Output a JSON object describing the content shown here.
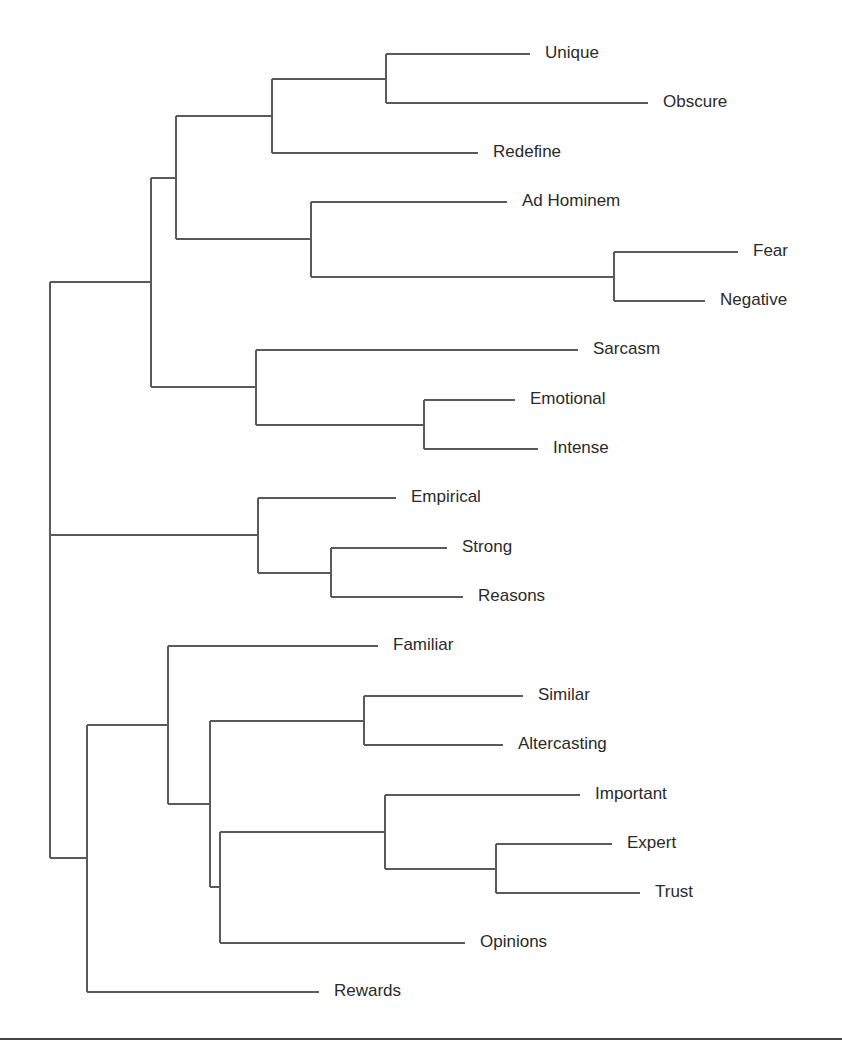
{
  "chart_data": {
    "type": "dendrogram",
    "title": "",
    "orientation": "horizontal",
    "leaves": [
      {
        "id": "unique",
        "label": "Unique",
        "y": 54,
        "x_end": 530
      },
      {
        "id": "obscure",
        "label": "Obscure",
        "y": 103,
        "x_end": 648
      },
      {
        "id": "redefine",
        "label": "Redefine",
        "y": 153,
        "x_end": 478
      },
      {
        "id": "ad-hominem",
        "label": "Ad Hominem",
        "y": 202,
        "x_end": 507
      },
      {
        "id": "fear",
        "label": "Fear",
        "y": 252,
        "x_end": 738
      },
      {
        "id": "negative",
        "label": "Negative",
        "y": 301,
        "x_end": 705
      },
      {
        "id": "sarcasm",
        "label": "Sarcasm",
        "y": 350,
        "x_end": 578
      },
      {
        "id": "emotional",
        "label": "Emotional",
        "y": 400,
        "x_end": 515
      },
      {
        "id": "intense",
        "label": "Intense",
        "y": 449,
        "x_end": 538
      },
      {
        "id": "empirical",
        "label": "Empirical",
        "y": 498,
        "x_end": 396
      },
      {
        "id": "strong",
        "label": "Strong",
        "y": 548,
        "x_end": 447
      },
      {
        "id": "reasons",
        "label": "Reasons",
        "y": 597,
        "x_end": 463
      },
      {
        "id": "familiar",
        "label": "Familiar",
        "y": 646,
        "x_end": 378
      },
      {
        "id": "similar",
        "label": "Similar",
        "y": 696,
        "x_end": 523
      },
      {
        "id": "altercasting",
        "label": "Altercasting",
        "y": 745,
        "x_end": 503
      },
      {
        "id": "important",
        "label": "Important",
        "y": 795,
        "x_end": 580
      },
      {
        "id": "expert",
        "label": "Expert",
        "y": 844,
        "x_end": 612
      },
      {
        "id": "trust",
        "label": "Trust",
        "y": 893,
        "x_end": 640
      },
      {
        "id": "opinions",
        "label": "Opinions",
        "y": 943,
        "x_end": 465
      },
      {
        "id": "rewards",
        "label": "Rewards",
        "y": 992,
        "x_end": 319
      }
    ],
    "nodes": [
      {
        "id": "n_unique_obscure",
        "x": 386,
        "children": [
          "unique",
          "obscure"
        ]
      },
      {
        "id": "n_uo_redefine",
        "x": 272,
        "children": [
          "n_unique_obscure",
          "redefine"
        ]
      },
      {
        "id": "n_fear_negative",
        "x": 614,
        "children": [
          "fear",
          "negative"
        ]
      },
      {
        "id": "n_adhom_fn",
        "x": 311,
        "children": [
          "ad-hominem",
          "n_fear_negative"
        ]
      },
      {
        "id": "n_top4",
        "x": 176,
        "children": [
          "n_uo_redefine",
          "n_adhom_fn"
        ]
      },
      {
        "id": "n_emo_int",
        "x": 424,
        "children": [
          "emotional",
          "intense"
        ]
      },
      {
        "id": "n_sarc_ei",
        "x": 256,
        "children": [
          "sarcasm",
          "n_emo_int"
        ]
      },
      {
        "id": "n_upper",
        "x": 151,
        "children": [
          "n_top4",
          "n_sarc_ei"
        ]
      },
      {
        "id": "n_strong_reasons",
        "x": 331,
        "children": [
          "strong",
          "reasons"
        ]
      },
      {
        "id": "n_middle",
        "x": 258,
        "children": [
          "empirical",
          "n_strong_reasons"
        ]
      },
      {
        "id": "n_sim_alt",
        "x": 364,
        "children": [
          "similar",
          "altercasting"
        ]
      },
      {
        "id": "n_expert_trust",
        "x": 496,
        "children": [
          "expert",
          "trust"
        ]
      },
      {
        "id": "n_imp_et",
        "x": 385,
        "children": [
          "important",
          "n_expert_trust"
        ]
      },
      {
        "id": "n_iet_opinions",
        "x": 220,
        "children": [
          "n_imp_et",
          "opinions"
        ]
      },
      {
        "id": "n_sa_rest",
        "x": 210,
        "children": [
          "n_sim_alt",
          "n_iet_opinions"
        ]
      },
      {
        "id": "n_familiar_group",
        "x": 168,
        "children": [
          "familiar",
          "n_sa_rest"
        ]
      },
      {
        "id": "n_lower",
        "x": 87,
        "children": [
          "n_familiar_group",
          "rewards"
        ]
      },
      {
        "id": "root",
        "x": 50,
        "children": [
          "n_upper",
          "n_middle",
          "n_lower"
        ]
      }
    ],
    "root": "root",
    "xlabel": "",
    "ylabel": "",
    "grid": false,
    "legend": null
  },
  "style": {
    "line_color": "#5a5a5a",
    "text_color": "#2a2a2a",
    "rule_color": "#444444"
  }
}
